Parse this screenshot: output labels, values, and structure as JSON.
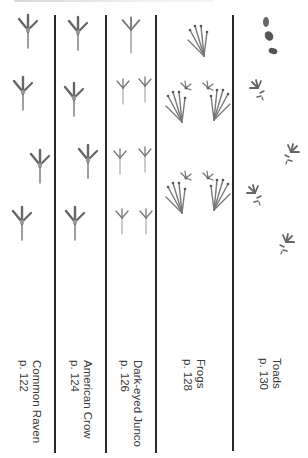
{
  "header": {
    "text": ""
  },
  "colors": {
    "divider": "#2a2a2a",
    "track": "#7a7a7a",
    "track_dark": "#555555",
    "label": "#3a3a3a"
  },
  "columns": [
    {
      "id": "raven",
      "title": "Common Raven",
      "page": "p. 122",
      "track_type": "bird-large"
    },
    {
      "id": "crow",
      "title": "American Crow",
      "page": "p. 124",
      "track_type": "bird-large"
    },
    {
      "id": "junco",
      "title": "Dark-eyed Junco",
      "page": "p. 126",
      "track_type": "bird-small"
    },
    {
      "id": "frogs",
      "title": "Frogs",
      "page": "p. 128",
      "track_type": "amphibian"
    },
    {
      "id": "toads",
      "title": "Toads",
      "page": "p. 130",
      "track_type": "amphibian"
    }
  ]
}
